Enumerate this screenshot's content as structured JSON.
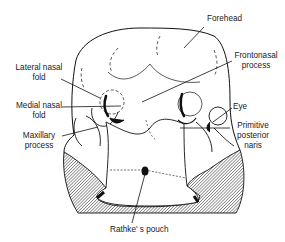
{
  "figure": {
    "type": "anatomical-diagram",
    "colors": {
      "line": "#111111",
      "hatch_bg": "#9a9a9a",
      "fill": "#ffffff"
    }
  },
  "labels": {
    "forehead": "Forehead",
    "frontonasal_1": "Frontonasal",
    "frontonasal_2": "process",
    "lateral_nasal_1": "Lateral nasal",
    "lateral_nasal_2": "fold",
    "medial_nasal_1": "Medial nasal",
    "medial_nasal_2": "fold",
    "eye": "Eye",
    "maxillary_1": "Maxillary",
    "maxillary_2": "process",
    "primitive_1": "Primitive",
    "primitive_2": "posterior",
    "primitive_3": "naris",
    "rathke": "Rathke' s pouch"
  }
}
